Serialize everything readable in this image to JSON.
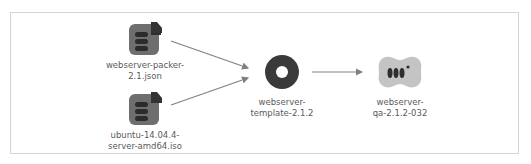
{
  "diagram": {
    "nodes": [
      {
        "id": "packer-json",
        "label": "webserver-packer-\n2.1.json",
        "icon": "file-document-icon"
      },
      {
        "id": "ubuntu-iso",
        "label": "ubuntu-14.04.4-\nserver-amd64.iso",
        "icon": "file-document-icon"
      },
      {
        "id": "template",
        "label": "webserver-\ntemplate-2.1.2",
        "icon": "disk-icon"
      },
      {
        "id": "qa-vm",
        "label": "webserver-\nqa-2.1.2-032",
        "icon": "server-vm-icon"
      }
    ],
    "edges": [
      {
        "from": "packer-json",
        "to": "template"
      },
      {
        "from": "ubuntu-iso",
        "to": "template"
      },
      {
        "from": "template",
        "to": "qa-vm"
      }
    ],
    "colors": {
      "icon_dark": "#3a3a3a",
      "file_bg": "#6e6e6e",
      "vm_bg": "#c4c4c4",
      "arrow": "#808080",
      "border": "#d4d4d4"
    }
  }
}
